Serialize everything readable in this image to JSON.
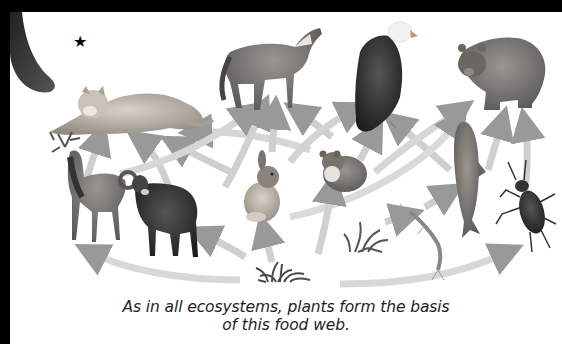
{
  "figure": {
    "marker": "★",
    "caption_line1": "As in all ecosystems, plants form the basis",
    "caption_line2": "of this food web.",
    "organisms": [
      {
        "id": "mountain-lion",
        "label": "Mountain lion",
        "trophic": "predator"
      },
      {
        "id": "wolf",
        "label": "Wolf",
        "trophic": "predator"
      },
      {
        "id": "bald-eagle",
        "label": "Bald eagle",
        "trophic": "predator"
      },
      {
        "id": "grizzly-bear",
        "label": "Grizzly bear",
        "trophic": "predator"
      },
      {
        "id": "elk",
        "label": "Elk",
        "trophic": "herbivore"
      },
      {
        "id": "bighorn-sheep",
        "label": "Bighorn sheep",
        "trophic": "herbivore"
      },
      {
        "id": "rabbit",
        "label": "Rabbit",
        "trophic": "herbivore"
      },
      {
        "id": "mouse",
        "label": "Mouse",
        "trophic": "herbivore"
      },
      {
        "id": "trout",
        "label": "Trout",
        "trophic": "consumer"
      },
      {
        "id": "beetle",
        "label": "Beetle",
        "trophic": "consumer"
      },
      {
        "id": "aquatic-insect",
        "label": "Aquatic insect larva",
        "trophic": "consumer"
      },
      {
        "id": "grass",
        "label": "Grass",
        "trophic": "producer"
      },
      {
        "id": "aquatic-plant",
        "label": "Aquatic plant",
        "trophic": "producer"
      }
    ],
    "colors": {
      "border": "#000000",
      "background": "#ffffff",
      "arrow_fill": "#d8d8d8",
      "arrow_head": "#9a9a9a",
      "caption_text": "#222222"
    }
  }
}
